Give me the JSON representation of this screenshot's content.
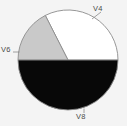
{
  "chart_data": {
    "type": "pie",
    "title": "",
    "xlabel": "",
    "ylabel": "",
    "grid": false,
    "legend_position": "none",
    "labels_position": "outside",
    "center": {
      "cx": 68,
      "cy": 60
    },
    "radius": 50,
    "start_angle_deg": 0,
    "direction": "counterclockwise",
    "categories": [
      "V4",
      "V6",
      "V8"
    ],
    "values": [
      32.5,
      17.5,
      50.0
    ],
    "angles_deg": [
      117,
      63,
      180
    ],
    "slice_colors": [
      "#ffffff",
      "#c9c9c9",
      "#080808"
    ],
    "outline_color": "#8c8c8c",
    "background_color": "#f4f4f4",
    "label_color": "#4a4a4a",
    "slices": [
      {
        "label": "V4",
        "value": 32.5,
        "angle_deg": 117,
        "color": "#ffffff",
        "start_deg": 0,
        "end_deg": 117,
        "path": "M 68 60 L 118 60 A 50 50 0 0 0 45.30 15.45 Z"
      },
      {
        "label": "V6",
        "value": 17.5,
        "angle_deg": 63,
        "color": "#c9c9c9",
        "start_deg": 117,
        "end_deg": 180,
        "path": "M 68 60 L 45.30 15.45 A 50 50 0 0 0 18 60 Z"
      },
      {
        "label": "V8",
        "value": 50.0,
        "angle_deg": 180,
        "color": "#080808",
        "start_deg": 180,
        "end_deg": 360,
        "path": "M 68 60 L 18 60 A 50 50 0 0 0 118 60 Z"
      }
    ],
    "leaders": [
      {
        "label": "V4",
        "path": "M 92 19 L 101 12"
      },
      {
        "label": "V6",
        "path": "M 19.5 52 L 13 52"
      },
      {
        "label": "V8",
        "path": "M 84 108.5 L 84 113"
      }
    ]
  }
}
